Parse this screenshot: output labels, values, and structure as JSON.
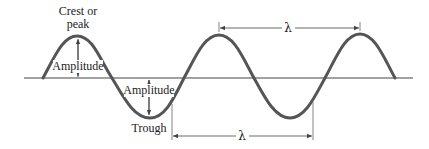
{
  "diagram": {
    "labels": {
      "crest_line1": "Crest or",
      "crest_line2": "peak",
      "amplitude_upper": "Amplitude",
      "amplitude_lower": "Amplitude",
      "trough": "Trough",
      "wavelength_upper": "λ",
      "wavelength_lower": "λ"
    },
    "colors": {
      "wave": "#555555",
      "axis": "#444444",
      "dimension_lines": "#444444",
      "text": "#222222"
    }
  }
}
